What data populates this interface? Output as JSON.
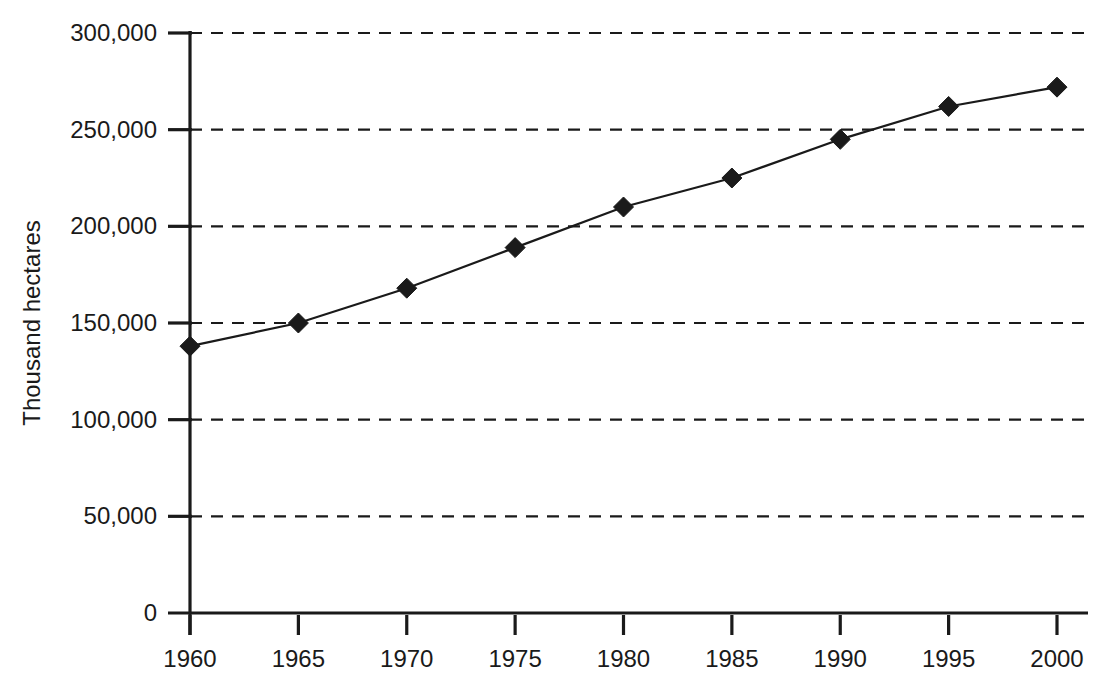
{
  "chart_data": {
    "type": "line",
    "title": "",
    "subtitle": "",
    "xlabel": "",
    "ylabel": "Thousand hectares",
    "x": [
      1960,
      1965,
      1970,
      1975,
      1980,
      1985,
      1990,
      1995,
      2000
    ],
    "values": [
      138000,
      150000,
      168000,
      189000,
      210000,
      225000,
      245000,
      262000,
      272000
    ],
    "series": [
      {
        "name": "Thousand hectares",
        "values": [
          138000,
          150000,
          168000,
          189000,
          210000,
          225000,
          245000,
          262000,
          272000
        ]
      }
    ],
    "xlim": [
      1960,
      2000
    ],
    "ylim": [
      0,
      300000
    ],
    "ytick_step": 50000,
    "xtick_step": 5,
    "x_tick_labels": [
      "1960",
      "1965",
      "1970",
      "1975",
      "1980",
      "1985",
      "1990",
      "1995",
      "2000"
    ],
    "y_tick_labels": [
      "0",
      "50,000",
      "100,000",
      "150,000",
      "200,000",
      "250,000",
      "300,000"
    ],
    "y_tick_values": [
      0,
      50000,
      100000,
      150000,
      200000,
      250000,
      300000
    ],
    "grid": {
      "horizontal": true,
      "vertical": false,
      "style": "dashed"
    },
    "legend": {
      "visible": false,
      "position": "none",
      "entries": []
    },
    "marker": {
      "shape": "diamond",
      "color": "#1a1a1a",
      "size": 20
    },
    "line_color": "#1a1a1a",
    "background_color": "#ffffff",
    "axis_color": "#1a1a1a"
  }
}
